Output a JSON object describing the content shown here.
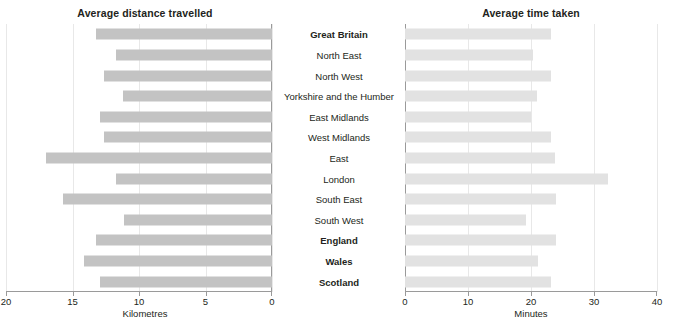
{
  "chart_data": [
    {
      "type": "bar",
      "orientation": "horizontal",
      "title": "Average distance travelled",
      "xlabel": "Kilometres",
      "ylabel": "",
      "xlim": [
        20,
        0
      ],
      "reversed_axis": true,
      "xticks": [
        20,
        15,
        10,
        5,
        0
      ],
      "grid": true,
      "legend": "none",
      "bar_color": "#c3c3c3",
      "categories": [
        "Great Britain",
        "North East",
        "North West",
        "Yorkshire and the Humber",
        "East Midlands",
        "West Midlands",
        "East",
        "London",
        "South East",
        "South West",
        "England",
        "Wales",
        "Scotland"
      ],
      "values": [
        13.2,
        11.7,
        12.6,
        11.2,
        12.9,
        12.6,
        17.0,
        11.7,
        15.7,
        11.1,
        13.2,
        14.1,
        12.9
      ]
    },
    {
      "type": "bar",
      "orientation": "horizontal",
      "title": "Average time taken",
      "xlabel": "Minutes",
      "ylabel": "",
      "xlim": [
        0,
        40
      ],
      "reversed_axis": false,
      "xticks": [
        0,
        10,
        20,
        30,
        40
      ],
      "grid": true,
      "legend": "none",
      "bar_color": "#e2e2e2",
      "categories": [
        "Great Britain",
        "North East",
        "North West",
        "Yorkshire and the Humber",
        "East Midlands",
        "West Midlands",
        "East",
        "London",
        "South East",
        "South West",
        "England",
        "Wales",
        "Scotland"
      ],
      "values": [
        23.2,
        20.3,
        23.2,
        21.0,
        20.0,
        23.2,
        23.8,
        32.2,
        24.0,
        19.2,
        24.0,
        21.1,
        23.2
      ]
    }
  ],
  "categories": [
    {
      "label": "Great Britain",
      "bold": true
    },
    {
      "label": "North East",
      "bold": false
    },
    {
      "label": "North West",
      "bold": false
    },
    {
      "label": "Yorkshire and the Humber",
      "bold": false
    },
    {
      "label": "East Midlands",
      "bold": false
    },
    {
      "label": "West Midlands",
      "bold": false
    },
    {
      "label": "East",
      "bold": false
    },
    {
      "label": "London",
      "bold": false
    },
    {
      "label": "South East",
      "bold": false
    },
    {
      "label": "South West",
      "bold": false
    },
    {
      "label": "England",
      "bold": true
    },
    {
      "label": "Wales",
      "bold": true
    },
    {
      "label": "Scotland",
      "bold": true
    }
  ],
  "left": {
    "title": "Average distance travelled",
    "caption": "Kilometres",
    "ticks": [
      "20",
      "15",
      "10",
      "5",
      "0"
    ]
  },
  "right": {
    "title": "Average time taken",
    "caption": "Minutes",
    "ticks": [
      "0",
      "10",
      "20",
      "30",
      "40"
    ]
  }
}
